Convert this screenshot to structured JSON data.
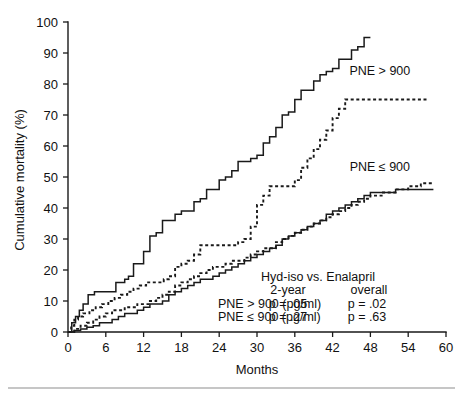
{
  "chart_data": {
    "type": "line",
    "title": "",
    "xlabel": "Months",
    "ylabel": "Cumulative mortality (%)",
    "xlim": [
      0,
      60
    ],
    "ylim": [
      0,
      100
    ],
    "xticks": [
      0,
      6,
      12,
      18,
      24,
      30,
      36,
      42,
      48,
      54,
      60
    ],
    "yticks": [
      0,
      10,
      20,
      30,
      40,
      50,
      60,
      70,
      80,
      90,
      100
    ],
    "grid": false,
    "legend_position": "inline-annotations",
    "series": [
      {
        "name": "PNE > 900, Enalapril",
        "style": "solid",
        "x": [
          0,
          0.6,
          1.2,
          1.8,
          2.4,
          3.2,
          4.2,
          5.4,
          6.6,
          7.6,
          8.4,
          9.0,
          9.6,
          10.4,
          11.2,
          12.0,
          13.0,
          14.0,
          15.0,
          16.0,
          17.0,
          18.0,
          19.0,
          20.0,
          21.0,
          22.0,
          23.0,
          24.0,
          25.0,
          26.0,
          27.0,
          28.0,
          29.0,
          30.0,
          31.0,
          32.0,
          33.0,
          34.0,
          35.0,
          36.0,
          37.0,
          38.0,
          39.0,
          40.0,
          41.0,
          42.0,
          43.0,
          44.0,
          45.0,
          46.0,
          47.0,
          48.0
        ],
        "y": [
          0,
          3,
          5,
          7,
          9,
          12,
          13,
          13,
          13,
          16,
          16,
          17,
          18,
          22,
          22,
          26,
          31,
          32,
          36,
          36,
          38,
          39,
          39,
          42,
          43,
          46,
          46,
          49,
          50,
          52,
          55,
          55,
          56,
          57,
          61,
          63,
          66,
          70,
          71,
          75,
          78,
          78,
          81,
          83,
          84,
          85,
          88,
          88,
          91,
          92,
          95,
          95
        ]
      },
      {
        "name": "PNE > 900, Hyd-iso",
        "style": "dashed",
        "x": [
          0,
          0.5,
          1.0,
          1.6,
          2.4,
          3.4,
          4.4,
          5.4,
          6.4,
          7.4,
          8.4,
          9.4,
          10.4,
          11.4,
          12.4,
          13.4,
          14.4,
          15.2,
          16.0,
          17.0,
          18.0,
          19.0,
          20.0,
          21.0,
          22.0,
          23.0,
          24.0,
          25.0,
          26.0,
          27.0,
          28.0,
          29.0,
          30.0,
          31.0,
          32.0,
          33.0,
          34.0,
          36.0,
          37.0,
          38.0,
          39.0,
          40.0,
          41.0,
          42.0,
          43.0,
          44.0,
          45.0,
          57.0
        ],
        "y": [
          0,
          2,
          4,
          5,
          6,
          7,
          8,
          9,
          10,
          11,
          12,
          13,
          14,
          15,
          16,
          16,
          16,
          17,
          18,
          21,
          22,
          23,
          25,
          28,
          28,
          28,
          28,
          28,
          28,
          29,
          30,
          34,
          41,
          44,
          47,
          47,
          47,
          49,
          53,
          56,
          59,
          62,
          65,
          69,
          72,
          75,
          75,
          75
        ]
      },
      {
        "name": "PNE <= 900, Hyd-iso",
        "style": "dashed",
        "x": [
          0,
          1,
          2,
          3,
          4,
          5,
          6,
          7,
          8,
          9,
          10,
          11,
          12,
          13,
          14,
          15,
          16,
          17,
          18,
          19,
          20,
          21,
          22,
          23,
          24,
          25,
          26,
          27,
          28,
          29,
          30,
          31,
          32,
          33,
          34,
          35,
          36,
          37,
          38,
          39,
          40,
          41,
          42,
          43,
          44,
          45,
          46,
          47,
          48,
          50,
          52,
          54,
          56,
          58
        ],
        "y": [
          0,
          1,
          2,
          3,
          4,
          5,
          6,
          7,
          7,
          8,
          8,
          9,
          9,
          10,
          11,
          12,
          13,
          15,
          16,
          17,
          18,
          19,
          20,
          21,
          21,
          22,
          23,
          23,
          24,
          25,
          26,
          27,
          27,
          29,
          30,
          31,
          32,
          33,
          34,
          35,
          36,
          37,
          38,
          39,
          40,
          41,
          42,
          43,
          44,
          45,
          46,
          47,
          48,
          48
        ]
      },
      {
        "name": "PNE <= 900, Enalapril",
        "style": "solid",
        "x": [
          0,
          1,
          2,
          3,
          4,
          5,
          6,
          7,
          8,
          9,
          10,
          11,
          12,
          13,
          14,
          15,
          16,
          17,
          18,
          19,
          20,
          21,
          22,
          23,
          24,
          25,
          26,
          27,
          28,
          29,
          30,
          31,
          32,
          33,
          34,
          35,
          36,
          37,
          38,
          39,
          40,
          41,
          42,
          43,
          44,
          45,
          46,
          47,
          48,
          50,
          52,
          54,
          56,
          58
        ],
        "y": [
          0,
          0.5,
          1,
          1.5,
          2,
          3,
          3,
          4,
          5,
          6,
          6,
          7,
          8,
          9,
          9,
          10,
          12,
          13,
          14,
          15,
          16,
          17,
          17,
          18,
          19,
          20,
          21,
          22,
          23,
          24,
          25,
          26,
          27,
          28,
          30,
          31,
          32,
          33,
          34,
          35,
          36,
          38,
          39,
          40,
          41,
          42,
          43,
          44,
          45,
          45,
          46,
          46,
          46,
          46
        ]
      }
    ],
    "annotations": {
      "curve_labels": [
        {
          "text": "PNE > 900",
          "x_month": 49.5,
          "y_pct": 83
        },
        {
          "text": "PNE ≤ 900",
          "x_month": 49.5,
          "y_pct": 52
        }
      ],
      "stats_table": {
        "header_title": "Hyd-iso vs. Enalapril",
        "col_headers": [
          "2-year",
          "overall"
        ],
        "rows": [
          {
            "label": "PNE > 900 (pg/ml)",
            "two_year": "p = .05",
            "overall": "p = .02"
          },
          {
            "label": "PNE ≤ 900 (pg/ml)",
            "two_year": "p = .27",
            "overall": "p = .63"
          }
        ]
      }
    },
    "colors": {
      "axis": "#1a1a1a",
      "curve": "#1a1a1a",
      "background": "#ffffff",
      "footer_rule": "#8d8d8d"
    }
  }
}
